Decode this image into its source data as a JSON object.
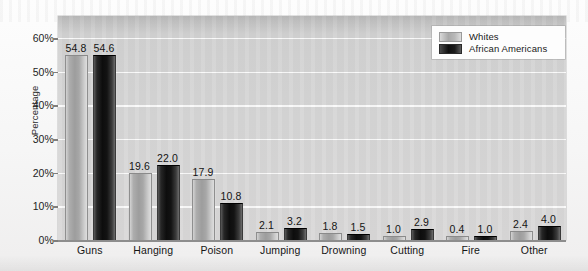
{
  "chart_data": {
    "type": "bar",
    "title": "",
    "xlabel": "",
    "ylabel": "Percentage",
    "ylim": [
      0,
      60
    ],
    "grid": true,
    "legend_position": "top-right",
    "categories": [
      "Guns",
      "Hanging",
      "Poison",
      "Jumping",
      "Drowning",
      "Cutting",
      "Fire",
      "Other"
    ],
    "ytick_labels": [
      "0%",
      "10%",
      "20%",
      "30%",
      "40%",
      "50%",
      "60%"
    ],
    "ytick_values": [
      0,
      10,
      20,
      30,
      40,
      50,
      60
    ],
    "series": [
      {
        "name": "Whites",
        "color": "#a8a8a8",
        "values": [
          54.8,
          19.6,
          17.9,
          2.1,
          1.8,
          1.0,
          0.4,
          2.4
        ],
        "labels": [
          "54.8",
          "19.6",
          "17.9",
          "2.1",
          "1.8",
          "1.0",
          "0.4",
          "2.4"
        ]
      },
      {
        "name": "African Americans",
        "color": "#101010",
        "values": [
          54.6,
          22.0,
          10.8,
          3.2,
          1.5,
          2.9,
          1.0,
          4.0
        ],
        "labels": [
          "54.6",
          "22.0",
          "10.8",
          "3.2",
          "1.5",
          "2.9",
          "1.0",
          "4.0"
        ]
      }
    ]
  },
  "legend": {
    "items": [
      {
        "label": "Whites"
      },
      {
        "label": "African Americans"
      }
    ]
  }
}
